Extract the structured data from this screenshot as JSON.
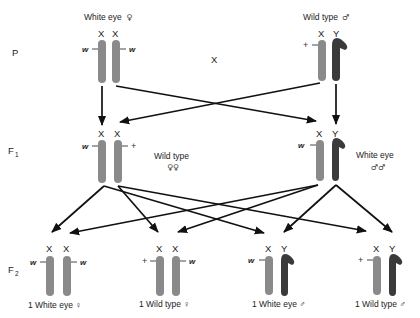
{
  "diagram": {
    "colors": {
      "x_chromosome": "#8a8a8a",
      "y_chromosome": "#3a3a3a",
      "arrow": "#111111",
      "text": "#222222"
    },
    "generations": [
      {
        "id": "P",
        "label": "P"
      },
      {
        "id": "F1",
        "label": "F",
        "sub": "1"
      },
      {
        "id": "F2",
        "label": "F",
        "sub": "2"
      }
    ],
    "cross_symbol": "X",
    "parents": {
      "female": {
        "phenotype": "White eye",
        "sex_symbol": "♀",
        "chromosomes": [
          "X",
          "X"
        ],
        "alleles": [
          "w",
          "w"
        ]
      },
      "male": {
        "phenotype": "Wild type",
        "sex_symbol": "♂",
        "chromosomes": [
          "X",
          "Y"
        ],
        "alleles": [
          "+",
          ""
        ]
      }
    },
    "f1": {
      "female": {
        "phenotype": "Wild type",
        "sex_symbol": "♀♀",
        "chromosomes": [
          "X",
          "X"
        ],
        "alleles": [
          "w",
          "+"
        ]
      },
      "male": {
        "phenotype": "White eye",
        "sex_symbol": "♂♂",
        "chromosomes": [
          "X",
          "Y"
        ],
        "alleles": [
          "w",
          ""
        ]
      }
    },
    "f2": [
      {
        "label": "1 White eye ♀",
        "chromosomes": [
          "X",
          "X"
        ],
        "alleles": [
          "w",
          "w"
        ]
      },
      {
        "label": "1 Wild type ♀",
        "chromosomes": [
          "X",
          "X"
        ],
        "alleles": [
          "+",
          "w"
        ]
      },
      {
        "label": "1 White eye ♂",
        "chromosomes": [
          "X",
          "Y"
        ],
        "alleles": [
          "w",
          ""
        ]
      },
      {
        "label": "1 Wild type ♂",
        "chromosomes": [
          "X",
          "Y"
        ],
        "alleles": [
          "+",
          ""
        ]
      }
    ]
  }
}
